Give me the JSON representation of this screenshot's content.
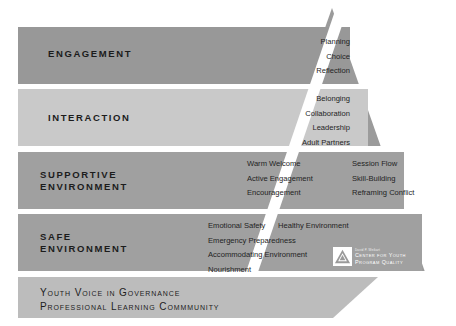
{
  "diagram": {
    "colors": {
      "background": "#ffffff",
      "pyramid": "#9b9b9b",
      "band_engagement": "#989898",
      "band_interaction": "#c9c9c9",
      "band_supportive": "#a0a0a0",
      "band_safe": "#a0a0a0",
      "band_foundation": "#bcbcbc",
      "separator": "#ffffff",
      "text_dark": "#1c1c1c",
      "text_light": "#ffffff"
    },
    "bands": [
      {
        "id": "engagement",
        "label": "ENGAGEMENT",
        "columns": [
          {
            "align": "right",
            "items": [
              "Planning",
              "Choice",
              "Reflection"
            ]
          }
        ]
      },
      {
        "id": "interaction",
        "label": "INTERACTION",
        "columns": [
          {
            "align": "right",
            "items": [
              "Belonging",
              "Collaboration",
              "Leadership",
              "Adult Partners"
            ]
          }
        ]
      },
      {
        "id": "supportive-environment",
        "label": "SUPPORTIVE\nENVIRONMENT",
        "columns": [
          {
            "align": "left",
            "items": [
              "Warm Welcome",
              "Active Engagement",
              "Encouragement"
            ]
          },
          {
            "align": "left",
            "items": [
              "Session Flow",
              "Skill-Building",
              "Reframing Conflict"
            ]
          }
        ]
      },
      {
        "id": "safe-environment",
        "label": "SAFE\nENVIRONMENT",
        "columns": [
          {
            "align": "left",
            "items": [
              "Emotional Safety",
              "Emergency Preparedness",
              "Accommodating Environment",
              "Nourishment"
            ]
          },
          {
            "align": "left",
            "items": [
              "Healthy Environment"
            ]
          }
        ]
      },
      {
        "id": "foundation",
        "label": "Youth Voice in Governance\nProfessional Learning Commmunity",
        "columns": []
      }
    ]
  },
  "logo": {
    "mark": "pyramid-mark-icon",
    "tagline": "David P. Weikart",
    "line1": "Center for Youth",
    "line2": "Program Quality"
  }
}
